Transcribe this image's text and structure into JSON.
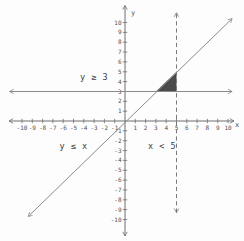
{
  "chart_data": {
    "type": "line",
    "axes": {
      "xlabel": "x",
      "ylabel": "y",
      "xlim": [
        -10,
        10
      ],
      "ylim": [
        -10,
        10
      ],
      "x_ticks": [
        -10,
        -9,
        -8,
        -7,
        -6,
        -5,
        -4,
        -3,
        -2,
        -1,
        1,
        2,
        3,
        4,
        5,
        6,
        7,
        8,
        9,
        10
      ],
      "y_ticks": [
        -10,
        -9,
        -8,
        -7,
        -6,
        -5,
        -4,
        -3,
        -2,
        -1,
        1,
        2,
        3,
        4,
        5,
        6,
        7,
        8,
        9,
        10
      ],
      "grid": false
    },
    "series": [
      {
        "name": "boundary y = 3",
        "inequality": "y ≥ 3",
        "style": "solid",
        "arrows": "both",
        "points": [
          [
            -11.2,
            3
          ],
          [
            10.4,
            3
          ]
        ]
      },
      {
        "name": "boundary y = x",
        "inequality": "y ≤ x",
        "style": "solid",
        "arrows": "both",
        "points": [
          [
            -9.4,
            -9.7
          ],
          [
            10.4,
            10.4
          ]
        ]
      },
      {
        "name": "boundary x = 5",
        "inequality": "x < 5",
        "style": "dashed",
        "arrows": "both",
        "points": [
          [
            5,
            -9.3
          ],
          [
            5,
            11
          ]
        ]
      }
    ],
    "shaded_region": {
      "description": "solution region of y ≥ 3, y ≤ x, x < 5",
      "vertices": [
        [
          3,
          3
        ],
        [
          5,
          3
        ],
        [
          5,
          5
        ]
      ],
      "fill": "#4b4b4b"
    },
    "annotations": [
      {
        "text": "y ≥ 3",
        "anchor": [
          -3,
          4.5
        ]
      },
      {
        "text": "y ≤ x",
        "anchor": [
          -5,
          -2.5
        ]
      },
      {
        "text": "x < 5",
        "anchor": [
          3.6,
          -2.5
        ]
      }
    ]
  },
  "colors": {
    "background": "#fdfdfd",
    "axis": "#6e6e6e",
    "boundary_line": "#8b8b8b",
    "dashed_line": "#7a7a7a",
    "shaded_region": "#4b4b4b",
    "text": "#4f4f4f"
  }
}
